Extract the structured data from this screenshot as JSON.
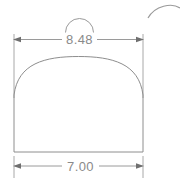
{
  "drawing": {
    "title": "Arc length dimensioned profile",
    "background_color": "#ffffff",
    "line_color": "#8e8e8e",
    "dimension_line_color": "#9a9a9a",
    "extension_line_color": "#a8a8a8",
    "arrow_color": "#6f6f6f",
    "text_color": "#8a8a8a"
  },
  "dimensions": {
    "top": {
      "value": "8.48",
      "label": "8.48",
      "type": "arc-length",
      "symbol": "arc-length-symbol",
      "position": "above-shape"
    },
    "bottom": {
      "value": "7.00",
      "label": "7.00",
      "type": "linear",
      "position": "below-shape"
    }
  },
  "shape": {
    "name": "domed-profile",
    "description": "closed profile with two vertical sides, flat base and a shallow circular arc top",
    "left_x": 14,
    "right_x": 143,
    "base_y": 152,
    "spring_y": 95,
    "apex_y": 57
  },
  "annotations": {
    "stray_arc": {
      "name": "cropped-arc-fragment",
      "description": "partial arc clipped at top-right corner"
    }
  }
}
